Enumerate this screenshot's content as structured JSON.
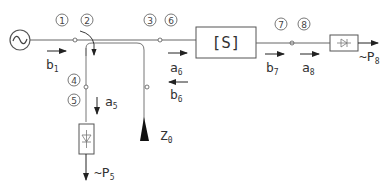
{
  "diagram": {
    "type": "microwave network / reflectometer schematic",
    "source": {
      "symbol": "~",
      "icon": "ac-source-icon"
    },
    "block": {
      "label": "[S]"
    },
    "termination": {
      "label": "Z",
      "sub": "0"
    },
    "ports": [
      "1",
      "2",
      "3",
      "4",
      "5",
      "6",
      "7",
      "8"
    ],
    "waves": {
      "b1": {
        "base": "b",
        "sub": "1"
      },
      "a5": {
        "base": "a",
        "sub": "5"
      },
      "a6": {
        "base": "a",
        "sub": "6"
      },
      "b6": {
        "base": "b",
        "sub": "6"
      },
      "b7": {
        "base": "b",
        "sub": "7"
      },
      "a8": {
        "base": "a",
        "sub": "8"
      }
    },
    "detectors": {
      "p5": {
        "prefix": "~P",
        "sub": "5"
      },
      "p8": {
        "prefix": "~P",
        "sub": "8"
      }
    },
    "colors": {
      "line": "#555555",
      "text": "#333333",
      "background": "#ffffff"
    }
  }
}
